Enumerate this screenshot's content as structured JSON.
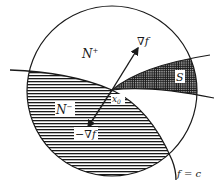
{
  "diagram": {
    "labels": {
      "n_plus": "N",
      "n_plus_sup": "+",
      "n_minus": "N",
      "n_minus_sup": "−",
      "grad": "∇f",
      "neg_grad": "−∇f",
      "s": "S",
      "x0": "x",
      "x0_sub": "0",
      "level": "f = c"
    },
    "colors": {
      "line": "#1a1a1a",
      "background": "#ffffff",
      "hatch": "#1a1a1a"
    }
  }
}
